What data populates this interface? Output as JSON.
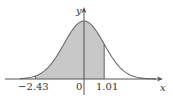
{
  "figure": {
    "type": "normal-distribution-curve",
    "x_axis_label": "x",
    "y_axis_label": "y",
    "tick_labels": [
      "-2.43",
      "0",
      "1.01"
    ],
    "shaded_region": {
      "from": -2.43,
      "to": 1.01
    },
    "colors": {
      "curve": "#6b6b6b",
      "shade": "#c8c8c8",
      "axis": "#555555",
      "text": "#333333"
    }
  },
  "labels": {
    "x": "x",
    "y": "y",
    "left": "−2.43",
    "zero": "0",
    "right": "1.01"
  }
}
